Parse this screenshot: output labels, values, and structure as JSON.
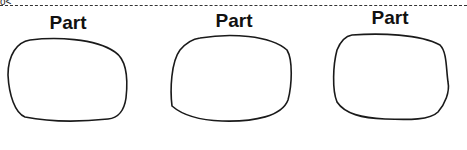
{
  "diagram": {
    "corner_glyph": "o<",
    "parts": [
      {
        "label": "Part"
      },
      {
        "label": "Part"
      },
      {
        "label": "Part"
      }
    ],
    "stroke_color": "#1a1a1a",
    "dash_color": "#333333"
  }
}
